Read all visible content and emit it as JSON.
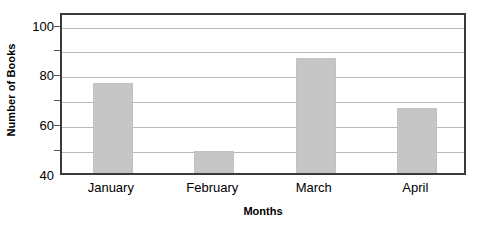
{
  "chart_data": {
    "type": "bar",
    "title": "",
    "categories": [
      "January",
      "February",
      "March",
      "April"
    ],
    "values": [
      76,
      49,
      86,
      66
    ],
    "xlabel": "Months",
    "ylabel": "Number of Books",
    "ylim": [
      40,
      105
    ],
    "ytick_labels": [
      "40",
      "60",
      "80",
      "100"
    ],
    "ytick_values": [
      40,
      60,
      80,
      100
    ],
    "gridline_values": [
      50,
      60,
      70,
      80,
      90,
      100
    ],
    "minor_tick_values": [
      50,
      60,
      70,
      80,
      90,
      100
    ],
    "grid": true,
    "legend": false,
    "bar_color": "#c6c6c6",
    "axis_color": "#3a3a3a",
    "gridline_color": "#b9b9b9"
  }
}
